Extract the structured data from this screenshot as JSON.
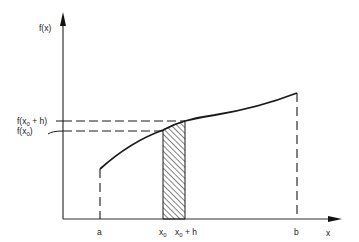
{
  "diagram": {
    "title": "",
    "type": "function integral strip illustration",
    "axes": {
      "y_label": "f(x)",
      "x_label": "x"
    },
    "x_ticks": [
      {
        "label": "a",
        "base": "a",
        "sub": "",
        "suffix": ""
      },
      {
        "label": "x0",
        "base": "x",
        "sub": "0",
        "suffix": ""
      },
      {
        "label": "x0 + h",
        "base": "x",
        "sub": "0",
        "suffix": " + h"
      },
      {
        "label": "b",
        "base": "b",
        "sub": "",
        "suffix": ""
      }
    ],
    "y_ticks": [
      {
        "label": "f(x0 + h)",
        "pre": "f(x",
        "sub": "0",
        "post": " + h)"
      },
      {
        "label": "f(x0)",
        "pre": "f(x",
        "sub": "0",
        "post": ")"
      }
    ],
    "elements": [
      "curve f(x) from a to b",
      "dashed verticals at a and b",
      "hatched strip between x0 and x0 + h",
      "dashed horizontals at f(x0) and f(x0 + h)"
    ],
    "colors": {
      "line": "#1a1a1a",
      "axis": "#333333",
      "background": "#ffffff"
    }
  }
}
